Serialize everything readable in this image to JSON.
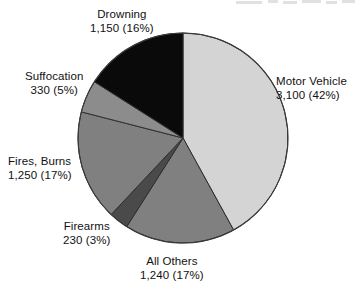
{
  "chart_data": {
    "type": "pie",
    "title": "",
    "subtitle": "",
    "xlabel": "",
    "ylabel": "",
    "legend_position": "none",
    "grid": false,
    "total": 7300,
    "categories": [
      "Motor Vehicle",
      "All Others",
      "Firearms",
      "Fires, Burns",
      "Suffocation",
      "Drowning"
    ],
    "values": [
      3100,
      1240,
      230,
      1250,
      330,
      1150
    ],
    "percents": [
      42,
      17,
      3,
      17,
      5,
      16
    ],
    "colors": [
      "#d4d4d4",
      "#808080",
      "#4a4a4a",
      "#808080",
      "#8c8c8c",
      "#0a0a0a"
    ],
    "slices": [
      {
        "name": "Motor Vehicle",
        "value": 3100,
        "percent": 42,
        "value_text": "3,100 (42%)",
        "label": "Motor Vehicle",
        "color": "#d4d4d4",
        "start_angle": 0,
        "end_angle": 151.2
      },
      {
        "name": "All Others",
        "value": 1240,
        "percent": 17,
        "value_text": "1,240 (17%)",
        "label": "All Others",
        "color": "#808080",
        "start_angle": 151.2,
        "end_angle": 212.4
      },
      {
        "name": "Firearms",
        "value": 230,
        "percent": 3,
        "value_text": "230 (3%)",
        "label": "Firearms",
        "color": "#4a4a4a",
        "start_angle": 212.4,
        "end_angle": 223.2
      },
      {
        "name": "Fires, Burns",
        "value": 1250,
        "percent": 17,
        "value_text": "1,250 (17%)",
        "label": "Fires, Burns",
        "color": "#808080",
        "start_angle": 223.2,
        "end_angle": 284.4
      },
      {
        "name": "Suffocation",
        "value": 330,
        "percent": 5,
        "value_text": "330 (5%)",
        "label": "Suffocation",
        "color": "#8c8c8c",
        "start_angle": 284.4,
        "end_angle": 302.4
      },
      {
        "name": "Drowning",
        "value": 1150,
        "percent": 16,
        "value_text": "1,150 (16%)",
        "label": "Drowning",
        "color": "#0a0a0a",
        "start_angle": 302.4,
        "end_angle": 360
      }
    ]
  },
  "labels": {
    "drowning": {
      "line1": "Drowning",
      "line2": "1,150 (16%)"
    },
    "motor": {
      "line1": "Motor Vehicle",
      "line2": "3,100 (42%)"
    },
    "suffocation": {
      "line1": "Suffocation",
      "line2": "330 (5%)"
    },
    "fires": {
      "line1": "Fires, Burns",
      "line2": "1,250 (17%)"
    },
    "firearms": {
      "line1": "Firearms",
      "line2": "230 (3%)"
    },
    "allothers": {
      "line1": "All Others",
      "line2": "1,240 (17%)"
    }
  }
}
